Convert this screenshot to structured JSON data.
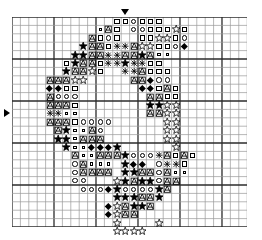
{
  "chart_data": {
    "type": "table",
    "grid": {
      "columns": 28,
      "rows": 25,
      "cell_size_px": 8.4,
      "heavy_line_every": 5,
      "origin_x_px": 12,
      "origin_y_px": 17,
      "line_color": "#2b2b2b",
      "minor_line_color": "#9a9a9a",
      "background": "#ffffff"
    },
    "center_markers": {
      "top_column": 14,
      "left_row": 12,
      "top_glyph": "triangle-down",
      "left_glyph": "triangle-right"
    },
    "symbol_key": {
      "fstar": "filled-star",
      "ostar": "open-star",
      "osq": "open-square",
      "ssq": "small-square",
      "ocir": "open-circle",
      "fdia": "filled-diamond",
      "hatch": "hatched-a",
      "cross": "cross-hatch"
    },
    "stitches": [
      {
        "r": 1,
        "c": 13,
        "s": "osq"
      },
      {
        "r": 1,
        "c": 14,
        "s": "osq"
      },
      {
        "r": 1,
        "c": 15,
        "s": "ocir"
      },
      {
        "r": 1,
        "c": 16,
        "s": "osq"
      },
      {
        "r": 1,
        "c": 17,
        "s": "osq"
      },
      {
        "r": 1,
        "c": 18,
        "s": "osq"
      },
      {
        "r": 2,
        "c": 11,
        "s": "ssq"
      },
      {
        "r": 2,
        "c": 12,
        "s": "hatch"
      },
      {
        "r": 2,
        "c": 13,
        "s": "osq"
      },
      {
        "r": 2,
        "c": 15,
        "s": "ocir"
      },
      {
        "r": 2,
        "c": 16,
        "s": "ocir"
      },
      {
        "r": 2,
        "c": 17,
        "s": "osq"
      },
      {
        "r": 2,
        "c": 18,
        "s": "osq"
      },
      {
        "r": 2,
        "c": 19,
        "s": "osq"
      },
      {
        "r": 2,
        "c": 20,
        "s": "ostar"
      },
      {
        "r": 2,
        "c": 21,
        "s": "osq"
      },
      {
        "r": 3,
        "c": 10,
        "s": "hatch"
      },
      {
        "r": 3,
        "c": 11,
        "s": "osq"
      },
      {
        "r": 3,
        "c": 12,
        "s": "ocir"
      },
      {
        "r": 3,
        "c": 13,
        "s": "osq"
      },
      {
        "r": 3,
        "c": 16,
        "s": "osq"
      },
      {
        "r": 3,
        "c": 17,
        "s": "osq"
      },
      {
        "r": 3,
        "c": 18,
        "s": "ostar"
      },
      {
        "r": 3,
        "c": 19,
        "s": "ostar"
      },
      {
        "r": 3,
        "c": 20,
        "s": "osq"
      },
      {
        "r": 3,
        "c": 21,
        "s": "ocir"
      },
      {
        "r": 4,
        "c": 9,
        "s": "fstar"
      },
      {
        "r": 4,
        "c": 10,
        "s": "hatch"
      },
      {
        "r": 4,
        "c": 11,
        "s": "hatch"
      },
      {
        "r": 4,
        "c": 12,
        "s": "osq"
      },
      {
        "r": 4,
        "c": 13,
        "s": "cross"
      },
      {
        "r": 4,
        "c": 14,
        "s": "cross"
      },
      {
        "r": 4,
        "c": 15,
        "s": "hatch"
      },
      {
        "r": 4,
        "c": 16,
        "s": "ostar"
      },
      {
        "r": 4,
        "c": 17,
        "s": "ostar"
      },
      {
        "r": 4,
        "c": 18,
        "s": "osq"
      },
      {
        "r": 4,
        "c": 19,
        "s": "osq"
      },
      {
        "r": 4,
        "c": 20,
        "s": "ocir"
      },
      {
        "r": 4,
        "c": 21,
        "s": "fdia"
      },
      {
        "r": 5,
        "c": 8,
        "s": "fstar"
      },
      {
        "r": 5,
        "c": 9,
        "s": "fstar"
      },
      {
        "r": 5,
        "c": 10,
        "s": "hatch"
      },
      {
        "r": 5,
        "c": 11,
        "s": "hatch"
      },
      {
        "r": 5,
        "c": 12,
        "s": "cross"
      },
      {
        "r": 5,
        "c": 13,
        "s": "cross"
      },
      {
        "r": 5,
        "c": 14,
        "s": "hatch"
      },
      {
        "r": 5,
        "c": 15,
        "s": "hatch"
      },
      {
        "r": 5,
        "c": 16,
        "s": "fstar"
      },
      {
        "r": 5,
        "c": 17,
        "s": "hatch"
      },
      {
        "r": 5,
        "c": 18,
        "s": "ssq"
      },
      {
        "r": 5,
        "c": 19,
        "s": "ssq"
      },
      {
        "r": 6,
        "c": 7,
        "s": "osq"
      },
      {
        "r": 6,
        "c": 8,
        "s": "fstar"
      },
      {
        "r": 6,
        "c": 9,
        "s": "hatch"
      },
      {
        "r": 6,
        "c": 10,
        "s": "hatch"
      },
      {
        "r": 6,
        "c": 11,
        "s": "osq"
      },
      {
        "r": 6,
        "c": 12,
        "s": "cross"
      },
      {
        "r": 6,
        "c": 13,
        "s": "cross"
      },
      {
        "r": 6,
        "c": 14,
        "s": "fstar"
      },
      {
        "r": 6,
        "c": 15,
        "s": "cross"
      },
      {
        "r": 6,
        "c": 16,
        "s": "cross"
      },
      {
        "r": 6,
        "c": 17,
        "s": "osq"
      },
      {
        "r": 6,
        "c": 18,
        "s": "osq"
      },
      {
        "r": 7,
        "c": 7,
        "s": "fstar"
      },
      {
        "r": 7,
        "c": 8,
        "s": "hatch"
      },
      {
        "r": 7,
        "c": 9,
        "s": "hatch"
      },
      {
        "r": 7,
        "c": 10,
        "s": "ostar"
      },
      {
        "r": 7,
        "c": 11,
        "s": "osq"
      },
      {
        "r": 7,
        "c": 14,
        "s": "cross"
      },
      {
        "r": 7,
        "c": 15,
        "s": "cross"
      },
      {
        "r": 7,
        "c": 16,
        "s": "hatch"
      },
      {
        "r": 7,
        "c": 17,
        "s": "osq"
      },
      {
        "r": 7,
        "c": 18,
        "s": "osq"
      },
      {
        "r": 7,
        "c": 19,
        "s": "osq"
      },
      {
        "r": 8,
        "c": 5,
        "s": "hatch"
      },
      {
        "r": 8,
        "c": 6,
        "s": "hatch"
      },
      {
        "r": 8,
        "c": 7,
        "s": "hatch"
      },
      {
        "r": 8,
        "c": 8,
        "s": "ostar"
      },
      {
        "r": 8,
        "c": 9,
        "s": "ostar"
      },
      {
        "r": 8,
        "c": 15,
        "s": "hatch"
      },
      {
        "r": 8,
        "c": 16,
        "s": "hatch"
      },
      {
        "r": 8,
        "c": 17,
        "s": "fdia"
      },
      {
        "r": 8,
        "c": 18,
        "s": "ocir"
      },
      {
        "r": 8,
        "c": 19,
        "s": "ocir"
      },
      {
        "r": 9,
        "c": 5,
        "s": "fdia"
      },
      {
        "r": 9,
        "c": 6,
        "s": "fdia"
      },
      {
        "r": 9,
        "c": 7,
        "s": "osq"
      },
      {
        "r": 9,
        "c": 8,
        "s": "osq"
      },
      {
        "r": 9,
        "c": 16,
        "s": "fdia"
      },
      {
        "r": 9,
        "c": 17,
        "s": "fdia"
      },
      {
        "r": 9,
        "c": 18,
        "s": "osq"
      },
      {
        "r": 9,
        "c": 19,
        "s": "hatch"
      },
      {
        "r": 9,
        "c": 20,
        "s": "osq"
      },
      {
        "r": 10,
        "c": 5,
        "s": "hatch"
      },
      {
        "r": 10,
        "c": 6,
        "s": "ocir"
      },
      {
        "r": 10,
        "c": 7,
        "s": "ocir"
      },
      {
        "r": 10,
        "c": 8,
        "s": "ocir"
      },
      {
        "r": 10,
        "c": 17,
        "s": "hatch"
      },
      {
        "r": 10,
        "c": 18,
        "s": "hatch"
      },
      {
        "r": 10,
        "c": 19,
        "s": "osq"
      },
      {
        "r": 10,
        "c": 20,
        "s": "osq"
      },
      {
        "r": 11,
        "c": 5,
        "s": "hatch"
      },
      {
        "r": 11,
        "c": 6,
        "s": "hatch"
      },
      {
        "r": 11,
        "c": 7,
        "s": "hatch"
      },
      {
        "r": 11,
        "c": 8,
        "s": "osq"
      },
      {
        "r": 11,
        "c": 17,
        "s": "fstar"
      },
      {
        "r": 11,
        "c": 18,
        "s": "fstar"
      },
      {
        "r": 11,
        "c": 19,
        "s": "ostar"
      },
      {
        "r": 11,
        "c": 20,
        "s": "ostar"
      },
      {
        "r": 12,
        "c": 5,
        "s": "cross"
      },
      {
        "r": 12,
        "c": 6,
        "s": "cross"
      },
      {
        "r": 12,
        "c": 7,
        "s": "ssq"
      },
      {
        "r": 12,
        "c": 8,
        "s": "ssq"
      },
      {
        "r": 12,
        "c": 17,
        "s": "hatch"
      },
      {
        "r": 12,
        "c": 18,
        "s": "hatch"
      },
      {
        "r": 12,
        "c": 19,
        "s": "ostar"
      },
      {
        "r": 12,
        "c": 20,
        "s": "ostar"
      },
      {
        "r": 13,
        "c": 5,
        "s": "hatch"
      },
      {
        "r": 13,
        "c": 6,
        "s": "hatch"
      },
      {
        "r": 13,
        "c": 7,
        "s": "hatch"
      },
      {
        "r": 13,
        "c": 8,
        "s": "osq"
      },
      {
        "r": 13,
        "c": 9,
        "s": "ocir"
      },
      {
        "r": 13,
        "c": 10,
        "s": "ocir"
      },
      {
        "r": 13,
        "c": 11,
        "s": "ocir"
      },
      {
        "r": 13,
        "c": 12,
        "s": "ocir"
      },
      {
        "r": 13,
        "c": 19,
        "s": "ostar"
      },
      {
        "r": 13,
        "c": 20,
        "s": "ostar"
      },
      {
        "r": 14,
        "c": 6,
        "s": "hatch"
      },
      {
        "r": 14,
        "c": 7,
        "s": "fstar"
      },
      {
        "r": 14,
        "c": 8,
        "s": "ssq"
      },
      {
        "r": 14,
        "c": 9,
        "s": "ssq"
      },
      {
        "r": 14,
        "c": 10,
        "s": "hatch"
      },
      {
        "r": 14,
        "c": 11,
        "s": "ocir"
      },
      {
        "r": 14,
        "c": 19,
        "s": "ostar"
      },
      {
        "r": 14,
        "c": 20,
        "s": "ostar"
      },
      {
        "r": 15,
        "c": 6,
        "s": "fstar"
      },
      {
        "r": 15,
        "c": 7,
        "s": "fstar"
      },
      {
        "r": 15,
        "c": 8,
        "s": "ssq"
      },
      {
        "r": 15,
        "c": 9,
        "s": "hatch"
      },
      {
        "r": 15,
        "c": 10,
        "s": "hatch"
      },
      {
        "r": 15,
        "c": 11,
        "s": "hatch"
      },
      {
        "r": 15,
        "c": 19,
        "s": "ostar"
      },
      {
        "r": 15,
        "c": 20,
        "s": "ostar"
      },
      {
        "r": 16,
        "c": 7,
        "s": "fstar"
      },
      {
        "r": 16,
        "c": 8,
        "s": "ssq"
      },
      {
        "r": 16,
        "c": 9,
        "s": "ssq"
      },
      {
        "r": 16,
        "c": 10,
        "s": "fdia"
      },
      {
        "r": 16,
        "c": 11,
        "s": "fdia"
      },
      {
        "r": 16,
        "c": 12,
        "s": "fdia"
      },
      {
        "r": 16,
        "c": 13,
        "s": "fstar"
      },
      {
        "r": 16,
        "c": 20,
        "s": "ostar"
      },
      {
        "r": 17,
        "c": 8,
        "s": "hatch"
      },
      {
        "r": 17,
        "c": 9,
        "s": "ssq"
      },
      {
        "r": 17,
        "c": 10,
        "s": "ssq"
      },
      {
        "r": 17,
        "c": 11,
        "s": "hatch"
      },
      {
        "r": 17,
        "c": 12,
        "s": "hatch"
      },
      {
        "r": 17,
        "c": 13,
        "s": "hatch"
      },
      {
        "r": 17,
        "c": 14,
        "s": "fstar"
      },
      {
        "r": 17,
        "c": 15,
        "s": "ocir"
      },
      {
        "r": 17,
        "c": 16,
        "s": "ocir"
      },
      {
        "r": 17,
        "c": 17,
        "s": "ocir"
      },
      {
        "r": 17,
        "c": 18,
        "s": "cross"
      },
      {
        "r": 17,
        "c": 19,
        "s": "hatch"
      },
      {
        "r": 17,
        "c": 20,
        "s": "osq"
      },
      {
        "r": 17,
        "c": 21,
        "s": "hatch"
      },
      {
        "r": 17,
        "c": 22,
        "s": "osq"
      },
      {
        "r": 18,
        "c": 8,
        "s": "ocir"
      },
      {
        "r": 18,
        "c": 9,
        "s": "hatch"
      },
      {
        "r": 18,
        "c": 10,
        "s": "ssq"
      },
      {
        "r": 18,
        "c": 11,
        "s": "ssq"
      },
      {
        "r": 18,
        "c": 12,
        "s": "ssq"
      },
      {
        "r": 18,
        "c": 14,
        "s": "fstar"
      },
      {
        "r": 18,
        "c": 15,
        "s": "fdia"
      },
      {
        "r": 18,
        "c": 16,
        "s": "fdia"
      },
      {
        "r": 18,
        "c": 18,
        "s": "ocir"
      },
      {
        "r": 18,
        "c": 19,
        "s": "cross"
      },
      {
        "r": 18,
        "c": 20,
        "s": "cross"
      },
      {
        "r": 18,
        "c": 21,
        "s": "osq"
      },
      {
        "r": 19,
        "c": 8,
        "s": "ocir"
      },
      {
        "r": 19,
        "c": 9,
        "s": "hatch"
      },
      {
        "r": 19,
        "c": 10,
        "s": "hatch"
      },
      {
        "r": 19,
        "c": 11,
        "s": "hatch"
      },
      {
        "r": 19,
        "c": 12,
        "s": "hatch"
      },
      {
        "r": 19,
        "c": 14,
        "s": "fstar"
      },
      {
        "r": 19,
        "c": 15,
        "s": "fstar"
      },
      {
        "r": 19,
        "c": 16,
        "s": "hatch"
      },
      {
        "r": 19,
        "c": 17,
        "s": "hatch"
      },
      {
        "r": 19,
        "c": 18,
        "s": "ocir"
      },
      {
        "r": 19,
        "c": 19,
        "s": "hatch"
      },
      {
        "r": 19,
        "c": 20,
        "s": "ssq"
      },
      {
        "r": 19,
        "c": 21,
        "s": "ssq"
      },
      {
        "r": 20,
        "c": 8,
        "s": "ocir"
      },
      {
        "r": 20,
        "c": 9,
        "s": "ocir"
      },
      {
        "r": 20,
        "c": 13,
        "s": "ostar"
      },
      {
        "r": 20,
        "c": 14,
        "s": "fstar"
      },
      {
        "r": 20,
        "c": 15,
        "s": "hatch"
      },
      {
        "r": 20,
        "c": 16,
        "s": "fstar"
      },
      {
        "r": 20,
        "c": 17,
        "s": "fstar"
      },
      {
        "r": 20,
        "c": 18,
        "s": "ocir"
      },
      {
        "r": 20,
        "c": 19,
        "s": "hatch"
      },
      {
        "r": 20,
        "c": 20,
        "s": "hatch"
      },
      {
        "r": 21,
        "c": 9,
        "s": "ocir"
      },
      {
        "r": 21,
        "c": 10,
        "s": "ocir"
      },
      {
        "r": 21,
        "c": 11,
        "s": "ocir"
      },
      {
        "r": 21,
        "c": 12,
        "s": "fdia"
      },
      {
        "r": 21,
        "c": 13,
        "s": "fstar"
      },
      {
        "r": 21,
        "c": 14,
        "s": "ocir"
      },
      {
        "r": 21,
        "c": 15,
        "s": "ocir"
      },
      {
        "r": 21,
        "c": 16,
        "s": "ocir"
      },
      {
        "r": 21,
        "c": 17,
        "s": "ocir"
      },
      {
        "r": 21,
        "c": 18,
        "s": "fstar"
      },
      {
        "r": 21,
        "c": 19,
        "s": "hatch"
      },
      {
        "r": 22,
        "c": 13,
        "s": "fstar"
      },
      {
        "r": 22,
        "c": 14,
        "s": "fstar"
      },
      {
        "r": 22,
        "c": 15,
        "s": "fstar"
      },
      {
        "r": 22,
        "c": 16,
        "s": "hatch"
      },
      {
        "r": 22,
        "c": 17,
        "s": "hatch"
      },
      {
        "r": 22,
        "c": 18,
        "s": "fstar"
      },
      {
        "r": 23,
        "c": 12,
        "s": "fdia"
      },
      {
        "r": 23,
        "c": 13,
        "s": "ostar"
      },
      {
        "r": 23,
        "c": 14,
        "s": "hatch"
      },
      {
        "r": 23,
        "c": 15,
        "s": "fstar"
      },
      {
        "r": 23,
        "c": 16,
        "s": "fstar"
      },
      {
        "r": 23,
        "c": 17,
        "s": "hatch"
      },
      {
        "r": 24,
        "c": 12,
        "s": "fdia"
      },
      {
        "r": 24,
        "c": 13,
        "s": "ostar"
      },
      {
        "r": 24,
        "c": 14,
        "s": "hatch"
      },
      {
        "r": 24,
        "c": 15,
        "s": "hatch"
      },
      {
        "r": 25,
        "c": 13,
        "s": "ostar"
      },
      {
        "r": 25,
        "c": 18,
        "s": "ostar"
      },
      {
        "r": 26,
        "c": 13,
        "s": "ostar"
      },
      {
        "r": 26,
        "c": 14,
        "s": "ostar"
      },
      {
        "r": 26,
        "c": 15,
        "s": "ostar"
      },
      {
        "r": 26,
        "c": 16,
        "s": "ostar"
      }
    ]
  }
}
